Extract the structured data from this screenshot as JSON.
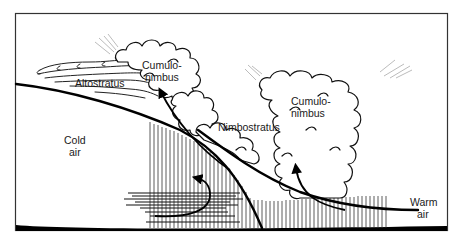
{
  "diagram": {
    "labels": {
      "altostratus": "Altostratus",
      "cumulonimbus_left_line1": "Cumulo-",
      "cumulonimbus_left_line2": "nimbus",
      "cumulonimbus_right_line1": "Cumulo-",
      "cumulonimbus_right_line2": "nimbus",
      "nimbostratus": "Nimbostratus",
      "cold_air_line1": "Cold",
      "cold_air_line2": "air",
      "warm_air_line1": "Warm",
      "warm_air_line2": "air"
    },
    "colors": {
      "ink": "#000000",
      "background": "#ffffff",
      "frame": "#333333"
    }
  }
}
